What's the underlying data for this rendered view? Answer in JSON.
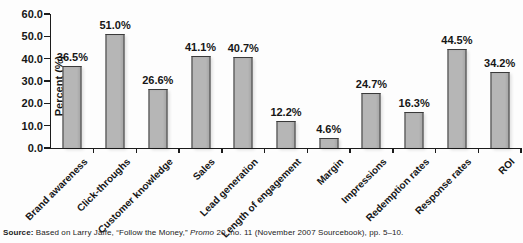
{
  "chart_data": {
    "type": "bar",
    "title": "",
    "xlabel": "",
    "ylabel": "Percent (%)",
    "categories": [
      "Brand awareness",
      "Click-throughs",
      "Customer knowledge",
      "Sales",
      "Lead generation",
      "Length of engagement",
      "Margin",
      "Impressions",
      "Redemption rates",
      "Response rates",
      "ROI"
    ],
    "values": [
      36.5,
      51.0,
      26.6,
      41.1,
      40.7,
      12.2,
      4.6,
      24.7,
      16.3,
      44.5,
      34.2
    ],
    "value_labels": [
      "36.5%",
      "51.0%",
      "26.6%",
      "41.1%",
      "40.7%",
      "12.2%",
      "4.6%",
      "24.7%",
      "16.3%",
      "44.5%",
      "34.2%"
    ],
    "ylim": [
      0,
      60
    ],
    "yticks": [
      60,
      50,
      40,
      30,
      20,
      10,
      0
    ],
    "ytick_labels": [
      "60.0",
      "50.0",
      "40.0",
      "30.0",
      "20.0",
      "10.0",
      "0.0"
    ],
    "grid": false,
    "legend_position": "none",
    "bar_color": "#b6b6b6",
    "bar_border_color": "#3a3a3a",
    "axis_color": "#1c1c1c"
  },
  "source": {
    "label": "Source:",
    "text_before_italic": " Based on Larry Jaffe, “Follow the Money,” ",
    "italic_text": "Promo",
    "text_after_italic": " 20, no. 11 (November 2007 Sourcebook), pp. 5–10."
  }
}
